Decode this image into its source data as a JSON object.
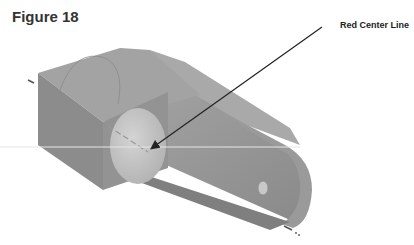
{
  "figure": {
    "title": "Figure 18",
    "callout_label": "Red Center Line"
  },
  "colors": {
    "part_face_front": "#8e8e8e",
    "part_face_top": "#a7a7a7",
    "part_face_side": "#7d7d7d",
    "hole_fill": "#c6c6c6",
    "center_line": "#e0e0e0",
    "leader_line": "#222222",
    "axis_dash": "#555555"
  }
}
